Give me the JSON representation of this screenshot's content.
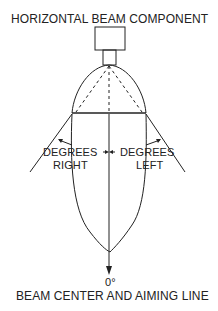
{
  "title": "HORIZONTAL BEAM COMPONENT",
  "labels": {
    "degrees_right_1": "DEGREES",
    "degrees_right_2": "RIGHT",
    "degrees_left_1": "DEGREES",
    "degrees_left_2": "LEFT",
    "zero": "0°",
    "bottom": "BEAM CENTER AND AIMING LINE"
  }
}
